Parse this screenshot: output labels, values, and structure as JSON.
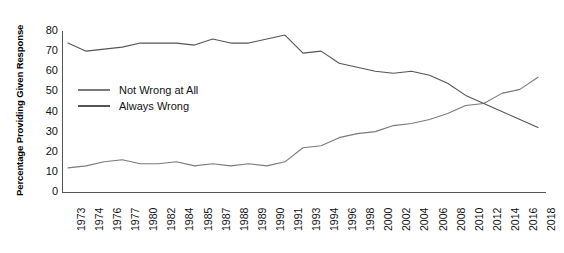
{
  "chart_data": {
    "type": "line",
    "title": "",
    "xlabel": "",
    "ylabel": "Percentage Providing Given Response",
    "ylim": [
      0,
      80
    ],
    "yticks": [
      0,
      10,
      20,
      30,
      40,
      50,
      60,
      70,
      80
    ],
    "grid": false,
    "legend_position": "inside-left",
    "categories": [
      "1973",
      "1974",
      "1976",
      "1977",
      "1980",
      "1982",
      "1984",
      "1985",
      "1987",
      "1988",
      "1989",
      "1990",
      "1991",
      "1993",
      "1994",
      "1996",
      "1998",
      "2000",
      "2002",
      "2004",
      "2006",
      "2008",
      "2010",
      "2012",
      "2014",
      "2016",
      "2018"
    ],
    "series": [
      {
        "name": "Not Wrong at All",
        "color": "#7a7a7a",
        "values": [
          12,
          13,
          15,
          16,
          14,
          14,
          15,
          13,
          14,
          13,
          14,
          13,
          15,
          22,
          23,
          27,
          29,
          30,
          33,
          34,
          36,
          39,
          43,
          44,
          49,
          51,
          57
        ]
      },
      {
        "name": "Always Wrong",
        "color": "#555555",
        "values": [
          74,
          70,
          71,
          72,
          74,
          74,
          74,
          73,
          76,
          74,
          74,
          76,
          78,
          69,
          70,
          64,
          62,
          60,
          59,
          60,
          58,
          54,
          48,
          44,
          40,
          36,
          32
        ]
      }
    ]
  },
  "legend": {
    "items": [
      {
        "label": "Not Wrong at All"
      },
      {
        "label": "Always Wrong"
      }
    ]
  }
}
